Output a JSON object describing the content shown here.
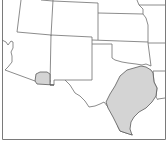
{
  "map": {
    "type": "regional range map",
    "region": "Southwestern / South-central United States",
    "states_visible": [
      "Nevada",
      "Utah",
      "Colorado",
      "Kansas",
      "Missouri",
      "Arizona",
      "New Mexico",
      "Oklahoma",
      "Arkansas",
      "Texas",
      "Louisiana"
    ],
    "highlighted_areas": [
      {
        "name": "southeast-arizona-area",
        "location": "Southeastern Arizona / southwestern New Mexico border",
        "fill": "#d4d4d4"
      },
      {
        "name": "central-east-texas-area",
        "location": "Central and East Texas",
        "fill": "#d4d4d4"
      }
    ],
    "colors": {
      "background": "#ffffff",
      "state_border": "#6e6e6e",
      "highlight_fill": "#d4d4d4",
      "frame": "#7a7a7a"
    }
  }
}
